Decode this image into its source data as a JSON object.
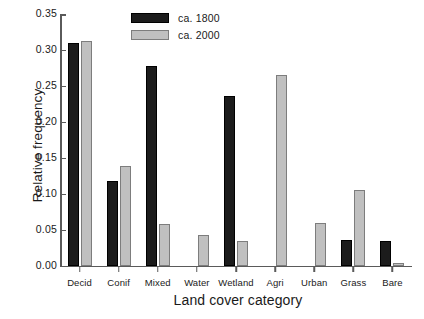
{
  "chart_data": {
    "type": "bar",
    "title": "",
    "xlabel": "Land cover category",
    "ylabel": "Relative frequency",
    "categories": [
      "Decid",
      "Conif",
      "Mixed",
      "Water",
      "Wetland",
      "Agri",
      "Urban",
      "Grass",
      "Bare"
    ],
    "series": [
      {
        "name": "ca. 1800",
        "color": "#1c1c1c",
        "values": [
          0.31,
          0.117,
          0.278,
          0.0,
          0.236,
          0.0,
          0.0,
          0.035,
          0.034
        ]
      },
      {
        "name": "ca. 2000",
        "color": "#c0c0c0",
        "values": [
          0.312,
          0.138,
          0.058,
          0.043,
          0.034,
          0.265,
          0.059,
          0.105,
          0.004
        ]
      }
    ],
    "ylim": [
      0.0,
      0.35
    ],
    "yticks": [
      "0.00",
      "0.05",
      "0.10",
      "0.15",
      "0.20",
      "0.25",
      "0.30",
      "0.35"
    ],
    "ytick_values": [
      0.0,
      0.05,
      0.1,
      0.15,
      0.2,
      0.25,
      0.3,
      0.35
    ],
    "grid": false,
    "legend_position": "top-center"
  }
}
